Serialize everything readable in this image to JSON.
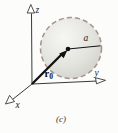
{
  "figure": {
    "type": "3d-axes-sphere-diagram",
    "caption": "(c)",
    "axis_labels": {
      "x": "x",
      "y": "y",
      "z": "z"
    },
    "sphere": {
      "radius_label": "a"
    },
    "position_vector": {
      "base": "r",
      "subscript": "0"
    },
    "colors": {
      "background": "#fcfcfa",
      "sphere_fill_light": "#f6f6f3",
      "sphere_fill_mid": "#e3e3de",
      "sphere_fill_dark": "#cfcfc8",
      "sphere_dash": "#a5938a",
      "ink": "#1c1c1c"
    }
  }
}
